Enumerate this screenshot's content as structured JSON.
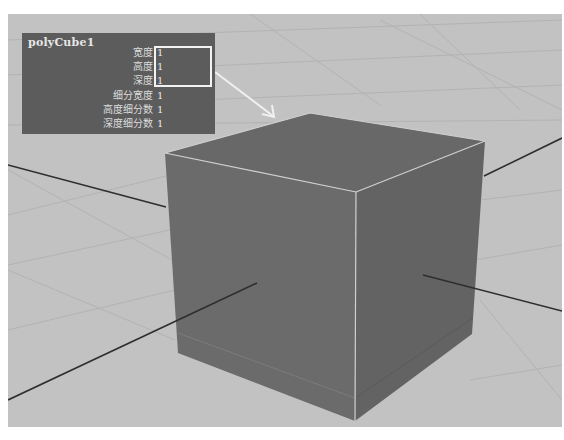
{
  "viewport": {
    "background_color": "#c2c2c2",
    "grid_color": "#b2b2b2",
    "axis_color": "#2a2a2a"
  },
  "object": {
    "name": "polyCube1",
    "faces": {
      "top_color": "#686868",
      "left_color": "#6c6c6c",
      "right_color": "#626262",
      "edge_color": "#cfcfcf"
    }
  },
  "attribute_panel": {
    "title": "polyCube1",
    "rows": [
      {
        "label": "宽度",
        "value": "1"
      },
      {
        "label": "高度",
        "value": "1"
      },
      {
        "label": "深度",
        "value": "1"
      },
      {
        "label": "细分宽度",
        "value": "1"
      },
      {
        "label": "高度细分数",
        "value": "1"
      },
      {
        "label": "深度细分数",
        "value": "1"
      }
    ],
    "highlighted_rows": [
      "宽度",
      "高度",
      "深度"
    ],
    "highlight_color": "#f2f2f2"
  },
  "annotation": {
    "arrow": "arrow-from-highlight-to-cube",
    "arrow_color": "#f0f0f0"
  }
}
